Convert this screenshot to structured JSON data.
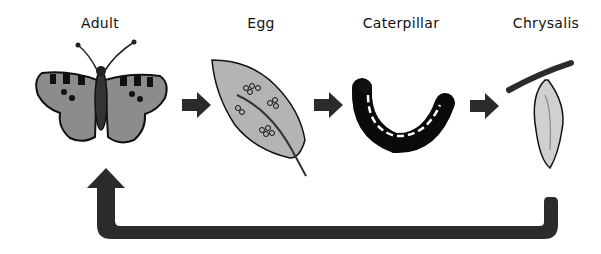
{
  "diagram": {
    "stages": [
      {
        "id": "adult",
        "label": "Adult"
      },
      {
        "id": "egg",
        "label": "Egg"
      },
      {
        "id": "caterpillar",
        "label": "Caterpillar"
      },
      {
        "id": "chrysalis",
        "label": "Chrysalis"
      }
    ],
    "colors": {
      "arrow": "#2b2b2b",
      "wing": "#8c8c8c",
      "leaf": "#b4b4b4",
      "outline": "#111111"
    }
  }
}
